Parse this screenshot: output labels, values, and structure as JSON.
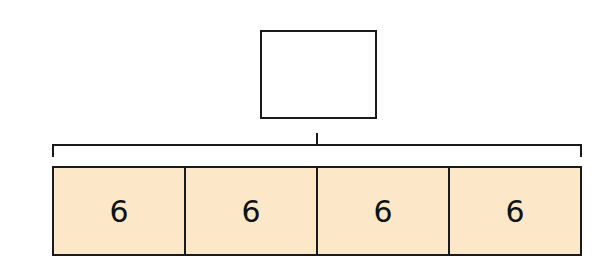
{
  "diagram": {
    "type": "bar-model",
    "whole": {
      "value": "",
      "label": "unknown total (empty box)"
    },
    "parts": [
      {
        "value": "6"
      },
      {
        "value": "6"
      },
      {
        "value": "6"
      },
      {
        "value": "6"
      }
    ],
    "colors": {
      "part_fill": "#fce8c8",
      "stroke": "#1a1a1a",
      "background": "#ffffff"
    }
  }
}
